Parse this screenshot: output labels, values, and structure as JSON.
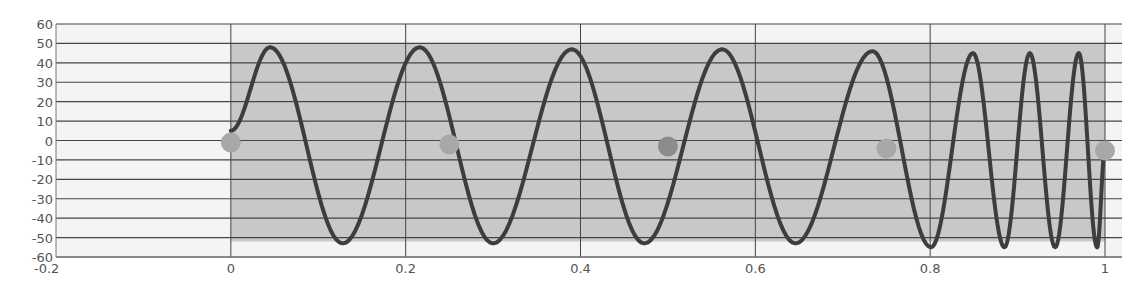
{
  "chart_data": {
    "type": "line",
    "title": "",
    "xlabel": "",
    "ylabel": "",
    "xlim": [
      -0.2,
      1.0
    ],
    "ylim": [
      -60,
      60
    ],
    "grid": {
      "horizontal": true,
      "vertical": true
    },
    "legend": null,
    "x_ticks": [
      -0.2,
      0,
      0.2,
      0.4,
      0.6,
      0.8,
      1
    ],
    "x_tick_labels": [
      "-0.2",
      "0",
      "0.2",
      "0.4",
      "0.6",
      "0.8",
      "1"
    ],
    "y_ticks": [
      60,
      50,
      40,
      30,
      20,
      10,
      0,
      -10,
      -20,
      -30,
      -40,
      -50,
      -60
    ],
    "y_tick_labels": [
      "60",
      "50",
      "40",
      "30",
      "20",
      "10",
      "0",
      "-10",
      "-20",
      "-30",
      "-40",
      "-50",
      "-60"
    ],
    "shaded_region": {
      "x": [
        0,
        1
      ],
      "y": [
        -52,
        50
      ],
      "color": "#c8c8c8"
    },
    "series": [
      {
        "name": "signal",
        "kind": "line",
        "color": "#3d3d3d",
        "description": "Sinusoid, amplitude ~50 (offset ~ -2), period ~0.172 for x in [0, 0.8], then period ~0.06 for x in [0.8, 1]",
        "x": [
          0,
          0.045,
          0.128,
          0.216,
          0.3,
          0.39,
          0.473,
          0.562,
          0.646,
          0.734,
          0.801,
          0.849,
          0.885,
          0.914,
          0.943,
          0.97,
          0.991,
          1.0
        ],
        "y": [
          5,
          48,
          -53,
          48,
          -53,
          47,
          -53,
          47,
          -53,
          46,
          -55,
          45,
          -55,
          45,
          -55,
          45,
          -55,
          -5
        ]
      },
      {
        "name": "markers",
        "kind": "scatter",
        "color": "#a8a8a8",
        "x": [
          0,
          0.25,
          0.5,
          0.75,
          1.0
        ],
        "y": [
          0,
          0,
          0,
          0,
          0
        ]
      }
    ]
  },
  "colors": {
    "background": "#ffffff",
    "plot_background": "#f4f4f4",
    "band": "#c8c8c8",
    "grid": "#444444",
    "line": "#3d3d3d",
    "marker": "#a8a8a8",
    "marker_dark": "#8c8c8c",
    "text": "#555555"
  }
}
